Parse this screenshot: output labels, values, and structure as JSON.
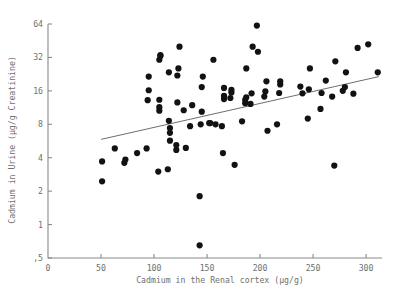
{
  "chart_data": {
    "type": "scatter",
    "title": "",
    "xlabel": "Cadmium in the Renal cortex (µg/g)",
    "ylabel": "Cadmium in Urine (µg/g Creatinine)",
    "xlim": [
      0,
      315
    ],
    "ylim": [
      0.5,
      64
    ],
    "yscale": "log2",
    "xscale": "linear",
    "grid": false,
    "legend": false,
    "xticks": [
      0,
      50,
      100,
      150,
      200,
      250,
      300
    ],
    "xticklabels": [
      "0",
      "50",
      "100",
      "150",
      "200",
      "250",
      "300"
    ],
    "yticks": [
      0.5,
      1,
      2,
      4,
      8,
      16,
      32,
      64
    ],
    "yticklabels": [
      ",5",
      "1",
      "2",
      "4",
      "8",
      "16",
      "32",
      "64"
    ],
    "marker": "filled-circle",
    "marker_color": "#121212",
    "marker_size": 3.1,
    "fit_line": {
      "label": "regression-line",
      "color": "#5d5d5d",
      "x0": 50,
      "y0": 5.85,
      "x1": 312,
      "y1": 21.5
    },
    "points": [
      [
        51,
        2.45
      ],
      [
        51,
        3.7
      ],
      [
        63,
        4.85
      ],
      [
        72,
        3.6
      ],
      [
        73,
        3.85
      ],
      [
        84,
        4.4
      ],
      [
        93,
        4.85
      ],
      [
        94,
        13.2
      ],
      [
        95,
        16.2
      ],
      [
        95,
        21.5
      ],
      [
        104,
        3.0
      ],
      [
        105,
        10.6
      ],
      [
        105,
        11.4
      ],
      [
        105,
        13.3
      ],
      [
        105,
        30.5
      ],
      [
        106,
        33.0
      ],
      [
        106,
        33.5
      ],
      [
        113,
        3.15
      ],
      [
        114,
        8.6
      ],
      [
        114,
        23.5
      ],
      [
        115,
        6.7
      ],
      [
        115,
        7.4
      ],
      [
        115,
        5.7
      ],
      [
        121,
        4.7
      ],
      [
        121,
        5.2
      ],
      [
        122,
        12.6
      ],
      [
        122,
        22.0
      ],
      [
        123,
        25.5
      ],
      [
        124,
        40.0
      ],
      [
        128,
        10.7
      ],
      [
        130,
        4.9
      ],
      [
        134,
        7.7
      ],
      [
        136,
        11.9
      ],
      [
        143,
        0.65
      ],
      [
        143,
        1.8
      ],
      [
        144,
        8.0
      ],
      [
        145,
        10.4
      ],
      [
        145,
        17.3
      ],
      [
        146,
        21.5
      ],
      [
        152,
        8.2
      ],
      [
        153,
        8.2
      ],
      [
        156,
        30.5
      ],
      [
        158,
        8.0
      ],
      [
        164,
        7.7
      ],
      [
        165,
        4.4
      ],
      [
        166,
        13.5
      ],
      [
        166,
        14.4
      ],
      [
        166,
        17.0
      ],
      [
        172,
        13.8
      ],
      [
        173,
        15.5
      ],
      [
        173,
        16.3
      ],
      [
        176,
        3.45
      ],
      [
        183,
        8.5
      ],
      [
        186,
        12.4
      ],
      [
        186,
        13.3
      ],
      [
        187,
        14.0
      ],
      [
        187,
        25.5
      ],
      [
        191,
        12.2
      ],
      [
        192,
        15.2
      ],
      [
        193,
        40.0
      ],
      [
        197,
        62.0
      ],
      [
        198,
        36.0
      ],
      [
        204,
        14.2
      ],
      [
        205,
        15.8
      ],
      [
        206,
        19.5
      ],
      [
        207,
        7.0
      ],
      [
        216,
        8.0
      ],
      [
        218,
        15.3
      ],
      [
        219,
        18.3
      ],
      [
        219,
        19.5
      ],
      [
        238,
        17.5
      ],
      [
        240,
        15.2
      ],
      [
        245,
        9.0
      ],
      [
        246,
        16.5
      ],
      [
        247,
        25.5
      ],
      [
        257,
        11.0
      ],
      [
        258,
        15.3
      ],
      [
        262,
        19.8
      ],
      [
        268,
        14.2
      ],
      [
        270,
        3.4
      ],
      [
        271,
        29.5
      ],
      [
        278,
        16.0
      ],
      [
        280,
        17.3
      ],
      [
        281,
        23.5
      ],
      [
        288,
        15.1
      ],
      [
        292,
        39.0
      ],
      [
        302,
        42.0
      ],
      [
        311,
        23.5
      ]
    ]
  }
}
